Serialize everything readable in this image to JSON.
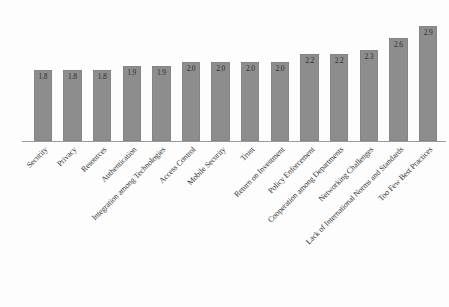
{
  "chart_data": {
    "type": "bar",
    "title": "",
    "subtitle": "",
    "xlabel": "",
    "ylabel": "",
    "ylim": [
      0,
      3.1
    ],
    "grid": false,
    "legend": false,
    "orientation": "vertical",
    "bar_color": "#8d8d8d",
    "background_color": "#ffffff",
    "axis_color": "#9a9a9a",
    "label_rotation": -45,
    "data_labels_shown": true,
    "categories": [
      "Security",
      "Privacy",
      "Resources",
      "Authentication",
      "Integration among Technologies",
      "Access Control",
      "Mobile Security",
      "Trust",
      "Return on Investment",
      "Policy Enforcement",
      "Cooperation among Departments",
      "Networking Challenges",
      "Lack of International Norms and Standards",
      "Too Few Best Practices"
    ],
    "values": [
      1.8,
      1.8,
      1.8,
      1.9,
      1.9,
      2.0,
      2.0,
      2.0,
      2.0,
      2.2,
      2.2,
      2.3,
      2.6,
      2.9
    ],
    "value_labels": [
      "1.8",
      "1.8",
      "1.8",
      "1.9",
      "1.9",
      "2.0",
      "2.0",
      "2.0",
      "2.0",
      "2.2",
      "2.2",
      "2.3",
      "2.6",
      "2.9"
    ]
  }
}
